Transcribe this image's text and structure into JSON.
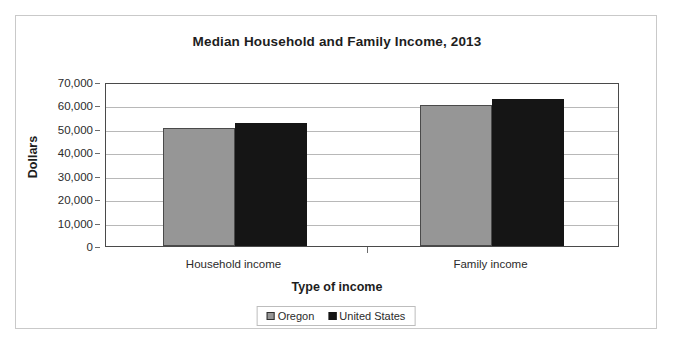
{
  "chart_data": {
    "type": "bar",
    "title": "Median Household and Family Income, 2013",
    "xlabel": "Type of income",
    "ylabel": "Dollars",
    "categories": [
      "Household income",
      "Family income"
    ],
    "series": [
      {
        "name": "Oregon",
        "color": "#969696",
        "values": [
          50200,
          60300
        ]
      },
      {
        "name": "United States",
        "color": "#151515",
        "values": [
          52300,
          62800
        ]
      }
    ],
    "ylim": [
      0,
      70000
    ],
    "ytick_values": [
      70000,
      60000,
      50000,
      40000,
      30000,
      20000,
      10000,
      0
    ],
    "ytick_labels": [
      "70,000",
      "60,000",
      "50,000",
      "40,000",
      "30,000",
      "20,000",
      "10,000",
      "0"
    ],
    "grid": true,
    "legend_position": "bottom"
  },
  "legend": {
    "entries": [
      {
        "label": "Oregon",
        "swatch": "legend-swatch-oregon"
      },
      {
        "label": "United States",
        "swatch": "legend-swatch-united-states"
      }
    ]
  }
}
